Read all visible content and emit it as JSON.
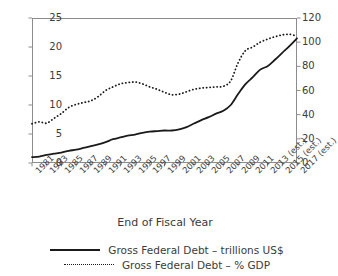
{
  "chart_data": {
    "type": "line",
    "title": "",
    "xlabel": "End of Fiscal Year",
    "ylabel": "",
    "grid": false,
    "legend_position": "bottom-center",
    "categories": [
      "1981",
      "1983",
      "1985",
      "1987",
      "1989",
      "1991",
      "1993",
      "1995",
      "1997",
      "1999",
      "2001",
      "2003",
      "2005",
      "2007",
      "2009",
      "2011",
      "2013 (est.)",
      "2015 (est.)",
      "2017 (est.)"
    ],
    "x_tick_labels": [
      "1981",
      "1983",
      "1985",
      "1987",
      "1989",
      "1991",
      "1993",
      "1995",
      "1997",
      "1999",
      "2001",
      "2003",
      "2005",
      "2007",
      "2009",
      "2011",
      "2013 (est.)",
      "2015 (est.)",
      "2017 (est.)"
    ],
    "axes": {
      "left": {
        "label": "",
        "ylim": [
          0,
          25
        ],
        "ticks": [
          0,
          5,
          10,
          15,
          20,
          25
        ],
        "tick_labels": [
          "0",
          "5",
          "10",
          "15",
          "20",
          "25"
        ]
      },
      "right": {
        "label": "",
        "ylim": [
          0,
          120
        ],
        "ticks": [
          0,
          20,
          40,
          60,
          80,
          100,
          120
        ],
        "tick_labels": [
          "0",
          "20",
          "40",
          "60",
          "80",
          "100",
          "120"
        ]
      }
    },
    "series": [
      {
        "name": "Gross Federal Debt – trillions US$",
        "axis": "left",
        "style": "solid",
        "color": "#1a1a1a",
        "x": [
          1981,
          1982,
          1983,
          1984,
          1985,
          1986,
          1987,
          1988,
          1989,
          1990,
          1991,
          1992,
          1993,
          1994,
          1995,
          1996,
          1997,
          1998,
          1999,
          2000,
          2001,
          2002,
          2003,
          2004,
          2005,
          2006,
          2007,
          2008,
          2009,
          2010,
          2011,
          2012,
          2013,
          2014,
          2015,
          2016,
          2017
        ],
        "values": [
          1.0,
          1.1,
          1.4,
          1.6,
          1.8,
          2.1,
          2.3,
          2.6,
          2.9,
          3.2,
          3.6,
          4.1,
          4.4,
          4.7,
          4.9,
          5.2,
          5.4,
          5.5,
          5.6,
          5.6,
          5.8,
          6.2,
          6.8,
          7.4,
          7.9,
          8.5,
          9.0,
          10.0,
          11.9,
          13.6,
          14.8,
          16.1,
          16.7,
          17.8,
          19.0,
          20.2,
          21.5
        ]
      },
      {
        "name": "Gross Federal Debt – % GDP",
        "axis": "right",
        "style": "dotted",
        "color": "#1a1a1a",
        "x": [
          1981,
          1982,
          1983,
          1984,
          1985,
          1986,
          1987,
          1988,
          1989,
          1990,
          1991,
          1992,
          1993,
          1994,
          1995,
          1996,
          1997,
          1998,
          1999,
          2000,
          2001,
          2002,
          2003,
          2004,
          2005,
          2006,
          2007,
          2008,
          2009,
          2010,
          2011,
          2012,
          2013,
          2014,
          2015,
          2016,
          2017
        ],
        "values": [
          32.5,
          34.0,
          33.0,
          37.0,
          41.0,
          46.0,
          48.5,
          50.0,
          51.5,
          55.0,
          60.0,
          63.0,
          65.5,
          66.5,
          67.0,
          65.5,
          63.0,
          61.0,
          58.5,
          56.5,
          57.0,
          59.0,
          61.0,
          62.0,
          62.5,
          63.0,
          63.5,
          68.0,
          83.0,
          93.0,
          96.0,
          100.0,
          102.5,
          104.5,
          106.0,
          106.5,
          105.0
        ]
      }
    ],
    "legend": [
      {
        "label": "Gross Federal Debt – trillions US$",
        "style": "solid"
      },
      {
        "label": "Gross Federal Debt – % GDP",
        "style": "dotted"
      }
    ]
  }
}
